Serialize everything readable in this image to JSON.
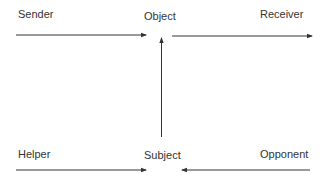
{
  "diagram": {
    "nodes": {
      "sender": "Sender",
      "object": "Object",
      "receiver": "Receiver",
      "helper": "Helper",
      "subject": "Subject",
      "opponent": "Opponent"
    },
    "edges": [
      {
        "from": "sender",
        "to": "object",
        "direction": "right"
      },
      {
        "from": "object",
        "to": "receiver",
        "direction": "right"
      },
      {
        "from": "subject",
        "to": "object",
        "direction": "up"
      },
      {
        "from": "helper",
        "to": "subject",
        "direction": "right"
      },
      {
        "from": "opponent",
        "to": "subject",
        "direction": "left"
      }
    ],
    "colors": {
      "line": "#333333",
      "background": "#ffffff"
    }
  }
}
